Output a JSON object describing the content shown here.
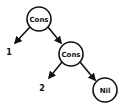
{
  "diagram": {
    "type": "tree",
    "nodes": [
      {
        "id": "cons1",
        "label": "Cons",
        "cx": 39,
        "cy": 19,
        "r": 12
      },
      {
        "id": "cons2",
        "label": "Cons",
        "cx": 71,
        "cy": 54,
        "r": 12
      },
      {
        "id": "nil",
        "label": "Nil",
        "cx": 105,
        "cy": 90,
        "r": 12
      }
    ],
    "leaves": [
      {
        "id": "one",
        "label": "1",
        "x": 9,
        "y": 56
      },
      {
        "id": "two",
        "label": "2",
        "x": 42,
        "y": 91
      }
    ],
    "edges": [
      {
        "from": "cons1",
        "to": "one"
      },
      {
        "from": "cons1",
        "to": "cons2"
      },
      {
        "from": "cons2",
        "to": "two"
      },
      {
        "from": "cons2",
        "to": "nil"
      }
    ]
  }
}
